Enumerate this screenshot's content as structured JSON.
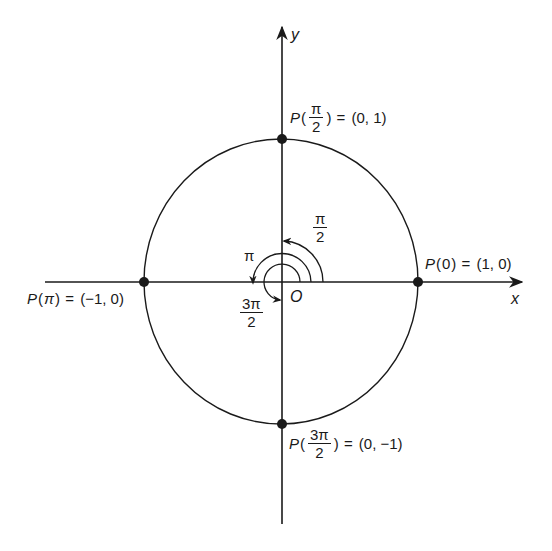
{
  "diagram": {
    "colors": {
      "stroke": "#1a1a1a",
      "background": "#ffffff"
    },
    "axes": {
      "x_label": "x",
      "y_label": "y",
      "origin_label": "O"
    },
    "points": [
      {
        "id": "p0",
        "prefix": "P",
        "arg": "0",
        "equals": "=",
        "coords": "(1, 0)"
      },
      {
        "id": "p_half_pi",
        "prefix": "P",
        "arg_num": "π",
        "arg_den": "2",
        "equals": "=",
        "coords": "(0, 1)"
      },
      {
        "id": "p_pi",
        "prefix": "P",
        "arg": "π",
        "equals": "=",
        "coords": "(−1, 0)"
      },
      {
        "id": "p_three_half_pi",
        "prefix": "P",
        "arg_num": "3π",
        "arg_den": "2",
        "equals": "=",
        "coords": "(0, −1)"
      }
    ],
    "angle_labels": {
      "half_pi": {
        "num": "π",
        "den": "2"
      },
      "pi": "π",
      "three_half_pi": {
        "num": "3π",
        "den": "2"
      }
    }
  }
}
